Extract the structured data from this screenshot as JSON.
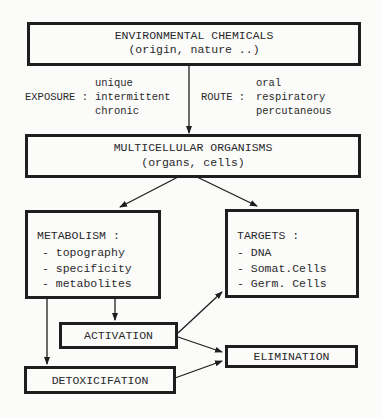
{
  "diagram": {
    "env_box": {
      "title": "ENVIRONMENTAL CHEMICALS",
      "subtitle": "(origin, nature ..)"
    },
    "exposure": {
      "label": "EXPOSURE :",
      "items": [
        "unique",
        "intermittent",
        "chronic"
      ]
    },
    "route": {
      "label": "ROUTE :",
      "items": [
        "oral",
        "respiratory",
        "percutaneous"
      ]
    },
    "organism_box": {
      "title": "MULTICELLULAR ORGANISMS",
      "subtitle": "(organs, cells)"
    },
    "metabolism_box": {
      "title": "METABOLISM :",
      "items": [
        "- topography",
        "- specificity",
        "- metabolites"
      ]
    },
    "targets_box": {
      "title": "TARGETS :",
      "items": [
        "- DNA",
        "- Somat.Cells",
        "- Germ. Cells"
      ]
    },
    "activation_box": {
      "label": "ACTIVATION"
    },
    "detoxification_box": {
      "label": "DETOXICIFATION"
    },
    "elimination_box": {
      "label": "ELIMINATION"
    },
    "colors": {
      "line": "#1e1e1e",
      "background": "#fbfbfa",
      "text": "#2a2a2a"
    }
  }
}
